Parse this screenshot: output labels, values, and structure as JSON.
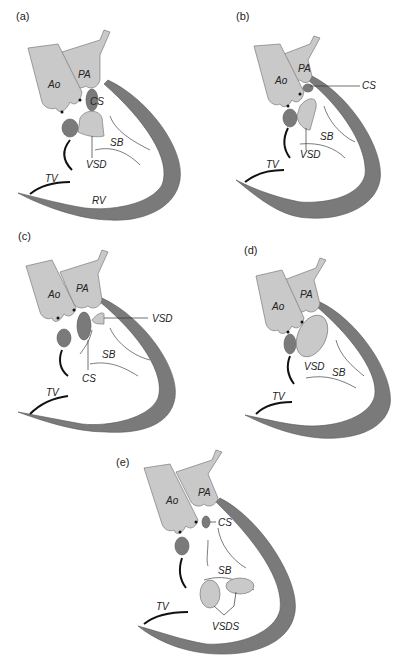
{
  "figure": {
    "panels": [
      {
        "id": "a",
        "label": "(a)",
        "structures": {
          "ao": "Ao",
          "pa": "PA",
          "cs": "CS",
          "sb": "SB",
          "vsd": "VSD",
          "tv": "TV",
          "rv": "RV"
        }
      },
      {
        "id": "b",
        "label": "(b)",
        "structures": {
          "ao": "Ao",
          "pa": "PA",
          "cs": "CS",
          "sb": "SB",
          "vsd": "VSD",
          "tv": "TV"
        }
      },
      {
        "id": "c",
        "label": "(c)",
        "structures": {
          "ao": "Ao",
          "pa": "PA",
          "cs": "CS",
          "sb": "SB",
          "vsd": "VSD",
          "tv": "TV"
        }
      },
      {
        "id": "d",
        "label": "(d)",
        "structures": {
          "ao": "Ao",
          "pa": "PA",
          "sb": "SB",
          "vsd": "VSD",
          "tv": "TV"
        }
      },
      {
        "id": "e",
        "label": "(e)",
        "structures": {
          "ao": "Ao",
          "pa": "PA",
          "cs": "CS",
          "sb": "SB",
          "vsds": "VSDS",
          "tv": "TV"
        }
      }
    ],
    "colors": {
      "great_arteries": "#c9c9c9",
      "ventricular_wall": "#7a7a7a",
      "background": "#ffffff"
    }
  }
}
